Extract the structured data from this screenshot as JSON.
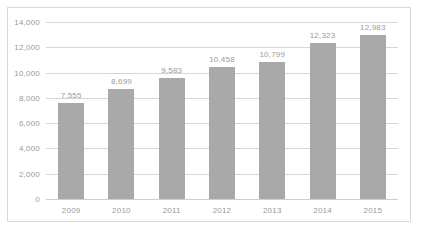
{
  "chart_data": {
    "type": "bar",
    "title": "",
    "subtitle": "",
    "xlabel": "",
    "ylabel": "",
    "categories": [
      "2009",
      "2010",
      "2011",
      "2012",
      "2013",
      "2014",
      "2015"
    ],
    "values": [
      7555,
      8699,
      9583,
      10458,
      10799,
      12323,
      12983
    ],
    "value_labels": [
      "7,555",
      "8,699",
      "9,583",
      "10,458",
      "10,799",
      "12,323",
      "12,983"
    ],
    "ylim": [
      0,
      14000
    ],
    "ytick_values": [
      0,
      2000,
      4000,
      6000,
      8000,
      10000,
      12000,
      14000
    ],
    "ytick_labels": [
      "0",
      "2,000",
      "4,000",
      "6,000",
      "8,000",
      "10,000",
      "12,000",
      "14,000"
    ],
    "grid": true,
    "legend": false,
    "legend_position": "none",
    "bar_color": "#a9a9a9",
    "gridline_color": "#d6d6d6",
    "text_color": "#9a9a9a",
    "background_color": "#ffffff",
    "border_color": "#d9d9d9"
  }
}
